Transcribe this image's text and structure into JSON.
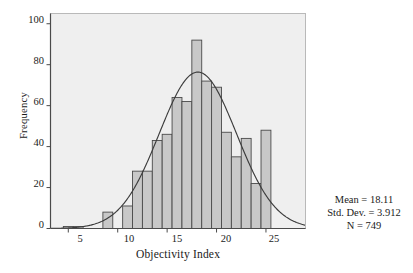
{
  "chart_data": {
    "type": "bar",
    "title": "",
    "subtitle": "",
    "xlabel": "Objectivity Index",
    "ylabel": "Frequency",
    "xlim": [
      3.2,
      29.0
    ],
    "ylim": [
      0,
      105
    ],
    "grid": false,
    "legend": null,
    "bin_width": 1,
    "categories": [
      5,
      6,
      7,
      8,
      9,
      10,
      11,
      12,
      13,
      14,
      15,
      16,
      17,
      18,
      19,
      20,
      21,
      22,
      23,
      24,
      25
    ],
    "values": [
      1,
      1,
      0,
      8,
      0,
      11,
      28,
      28,
      43,
      46,
      64,
      62,
      92,
      72,
      69,
      47,
      35,
      44,
      22,
      48,
      0
    ],
    "bars": [
      {
        "center": 5,
        "height": 1
      },
      {
        "center": 6,
        "height": 1
      },
      {
        "center": 9,
        "height": 8
      },
      {
        "center": 11,
        "height": 11
      },
      {
        "center": 12,
        "height": 28
      },
      {
        "center": 13,
        "height": 28
      },
      {
        "center": 14,
        "height": 43
      },
      {
        "center": 15,
        "height": 46
      },
      {
        "center": 16,
        "height": 64
      },
      {
        "center": 17,
        "height": 62
      },
      {
        "center": 18,
        "height": 92
      },
      {
        "center": 19,
        "height": 72
      },
      {
        "center": 20,
        "height": 69
      },
      {
        "center": 21,
        "height": 47
      },
      {
        "center": 22,
        "height": 35
      },
      {
        "center": 23,
        "height": 44
      },
      {
        "center": 24,
        "height": 22
      },
      {
        "center": 25,
        "height": 48
      }
    ],
    "xticks": [
      5,
      10,
      15,
      20,
      25
    ],
    "yticks": [
      0,
      20,
      40,
      60,
      80,
      100
    ],
    "curve": {
      "type": "normal",
      "mean": 18.11,
      "sd": 3.912,
      "n": 749,
      "peak_value": 75
    },
    "colors": {
      "bar_fill": "#c8c8c8",
      "bar_edge": "#4a4a4a",
      "plot_background": "#efefef",
      "curve": "#3c3c3c",
      "axis": "#4a4a4a",
      "text": "#1a1a1a"
    }
  },
  "stats_box": {
    "mean": "Mean = 18.11",
    "std_dev": "Std. Dev. = 3.912",
    "n": "N = 749"
  },
  "axes": {
    "y_label": "Frequency",
    "x_label": "Objectivity Index",
    "y_tick_labels": [
      "100",
      "80",
      "60",
      "40",
      "20",
      "0"
    ],
    "x_tick_labels": [
      "5",
      "10",
      "15",
      "20",
      "25"
    ]
  }
}
